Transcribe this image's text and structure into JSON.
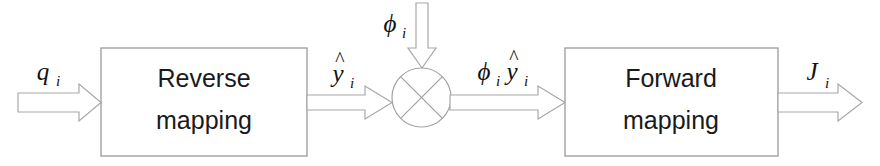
{
  "diagram": {
    "background_color": "#ffffff",
    "line_color": "#a2a2a2",
    "text_color": "#1a1a1a",
    "blocks": [
      {
        "id": "reverse-mapping",
        "line1": "Reverse",
        "line2": "mapping"
      },
      {
        "id": "forward-mapping",
        "line1": "Forward",
        "line2": "mapping"
      }
    ],
    "node": {
      "id": "multiplier",
      "symbol": "×",
      "shape": "circle-with-cross"
    },
    "signals": {
      "input": {
        "base": "q",
        "sub": "i",
        "full": "q_i"
      },
      "reverse_output": {
        "base": "y",
        "hat": "^",
        "sub": "i",
        "full": "ŷ_i"
      },
      "gain": {
        "base": "ϕ",
        "sub": "i",
        "full": "ϕ_i"
      },
      "scaled": {
        "base1": "ϕ",
        "sub1": "i",
        "base2": "y",
        "hat2": "^",
        "sub2": "i",
        "full": "ϕ_i ŷ_i"
      },
      "output": {
        "base": "J",
        "sub": "i",
        "full": "J_i"
      }
    }
  }
}
